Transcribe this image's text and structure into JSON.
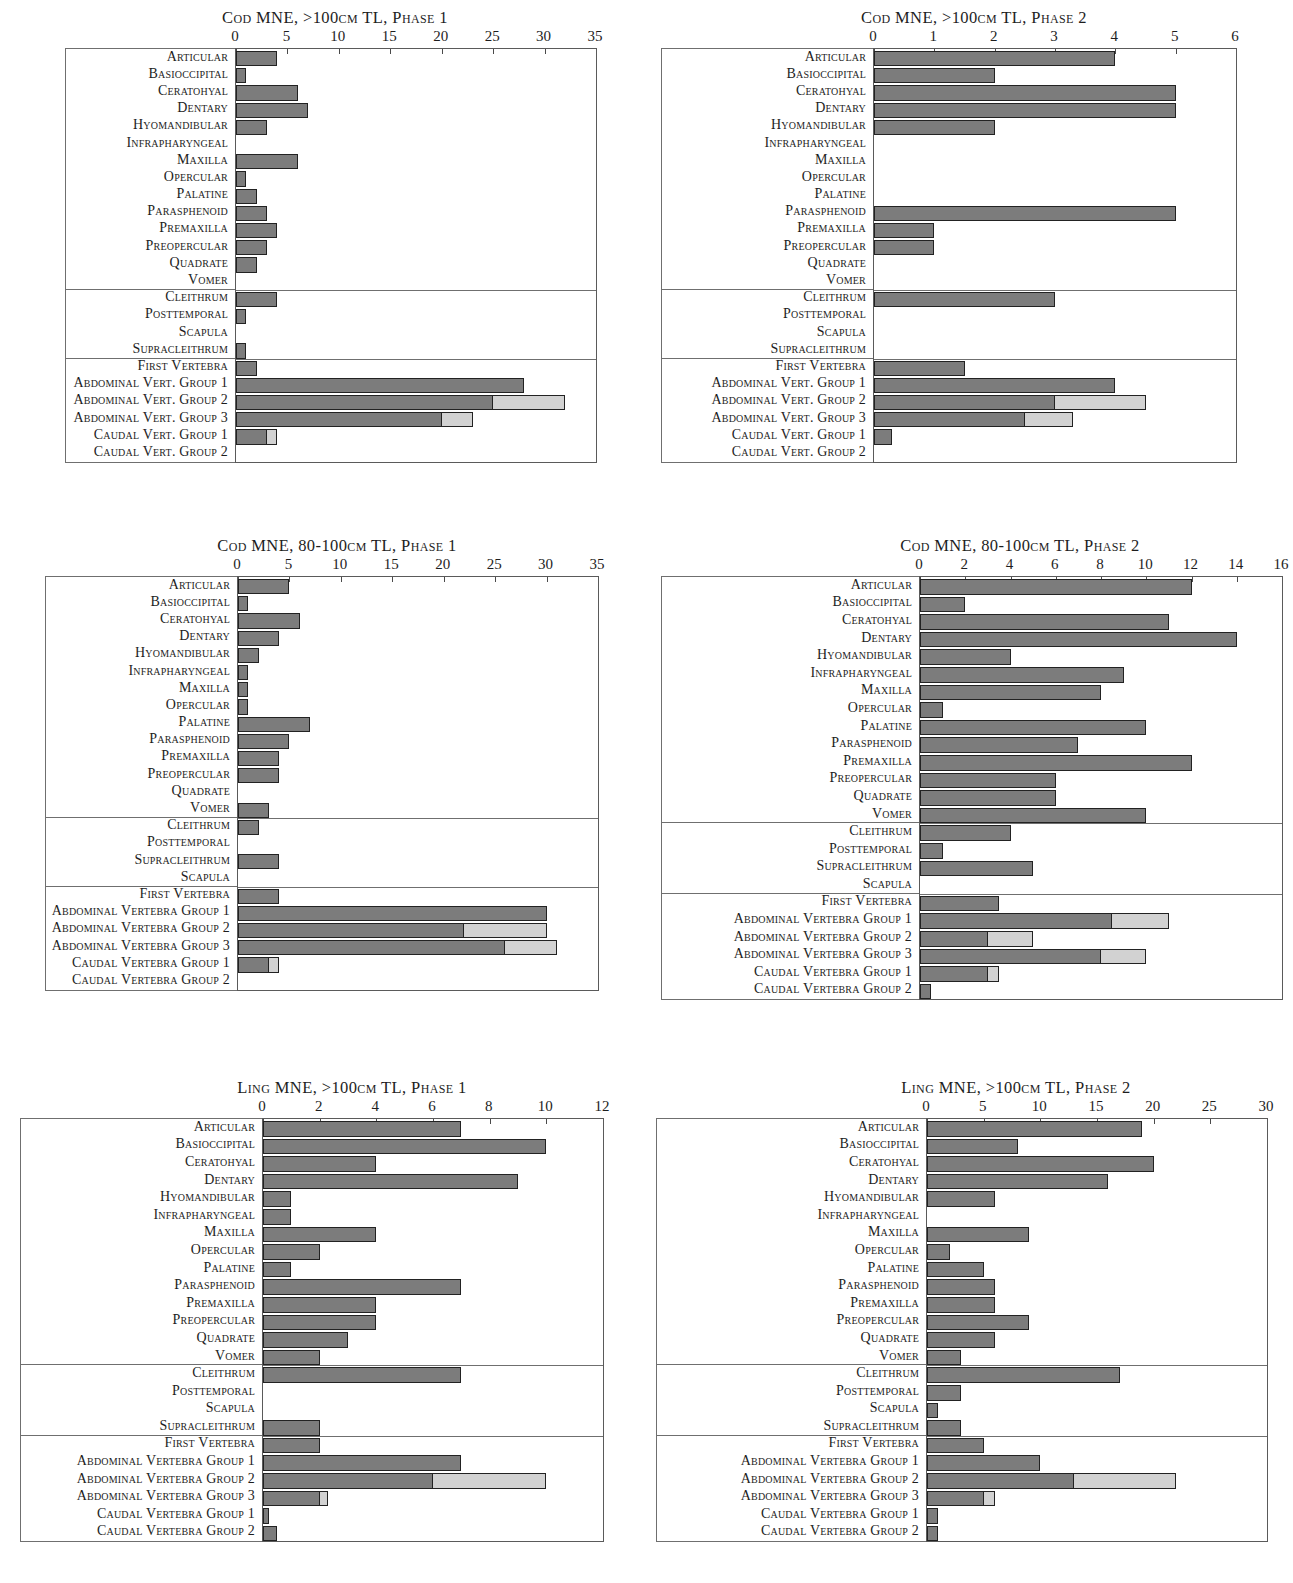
{
  "colors": {
    "bar_dark": "#7c7c7c",
    "bar_light": "#d2d2d2",
    "outline": "#222222",
    "axis": "#5a5a5a",
    "text": "#1d1d1d"
  },
  "charts": [
    {
      "id": "cod-gt100-phase1",
      "title": "Cod MNE, >100cm TL, Phase 1",
      "type": "bar",
      "orientation": "horizontal",
      "stacked": true,
      "xlabel": "",
      "ylabel": "",
      "xlim": [
        0,
        35
      ],
      "xticks": [
        0,
        5,
        10,
        15,
        20,
        25,
        30,
        35
      ],
      "grid": false,
      "legend": null,
      "series": [
        {
          "name": "identified",
          "color": "#7c7c7c"
        },
        {
          "name": "unidentified",
          "color": "#d2d2d2"
        }
      ],
      "group_breaks": [
        13,
        17
      ],
      "categories": [
        "Articular",
        "Basioccipital",
        "Ceratohyal",
        "Dentary",
        "Hyomandibular",
        "Infrapharyngeal",
        "Maxilla",
        "Opercular",
        "Palatine",
        "Parasphenoid",
        "Premaxilla",
        "Preopercular",
        "Quadrate",
        "Vomer",
        "Cleithrum",
        "Posttemporal",
        "Scapula",
        "Supracleithrum",
        "First Vertebra",
        "Abdominal Vert. Group 1",
        "Abdominal Vert. Group 2",
        "Abdominal Vert. Group 3",
        "Caudal Vert. Group 1",
        "Caudal Vert. Group 2"
      ],
      "values": [
        4,
        1,
        6,
        7,
        3,
        0,
        6,
        1,
        2,
        3,
        4,
        3,
        2,
        0,
        4,
        1,
        0,
        1,
        2,
        28,
        25,
        20,
        3,
        0
      ],
      "values_light": [
        0,
        0,
        0,
        0,
        0,
        0,
        0,
        0,
        0,
        0,
        0,
        0,
        0,
        0,
        0,
        0,
        0,
        0,
        0,
        0,
        7,
        3,
        1,
        0
      ]
    },
    {
      "id": "cod-gt100-phase2",
      "title": "Cod MNE, >100cm TL, Phase 2",
      "type": "bar",
      "orientation": "horizontal",
      "stacked": true,
      "xlabel": "",
      "ylabel": "",
      "xlim": [
        0,
        6
      ],
      "xticks": [
        0,
        1,
        2,
        3,
        4,
        5,
        6
      ],
      "grid": false,
      "legend": null,
      "series": [
        {
          "name": "identified",
          "color": "#7c7c7c"
        },
        {
          "name": "unidentified",
          "color": "#d2d2d2"
        }
      ],
      "group_breaks": [
        13,
        17
      ],
      "categories": [
        "Articular",
        "Basioccipital",
        "Ceratohyal",
        "Dentary",
        "Hyomandibular",
        "Infrapharyngeal",
        "Maxilla",
        "Opercular",
        "Palatine",
        "Parasphenoid",
        "Premaxilla",
        "Preopercular",
        "Quadrate",
        "Vomer",
        "Cleithrum",
        "Posttemporal",
        "Scapula",
        "Supracleithrum",
        "First Vertebra",
        "Abdominal Vert. Group 1",
        "Abdominal Vert. Group 2",
        "Abdominal Vert. Group 3",
        "Caudal Vert. Group 1",
        "Caudal Vert. Group 2"
      ],
      "values": [
        4,
        2,
        5,
        5,
        2,
        0,
        0,
        0,
        0,
        5,
        1,
        1,
        0,
        0,
        3,
        0,
        0,
        0,
        1.5,
        4,
        3,
        2.5,
        0.3,
        0
      ],
      "values_light": [
        0,
        0,
        0,
        0,
        0,
        0,
        0,
        0,
        0,
        0,
        0,
        0,
        0,
        0,
        0,
        0,
        0,
        0,
        0,
        0,
        1.5,
        0.8,
        0,
        0
      ]
    },
    {
      "id": "cod-80-100-phase1",
      "title": "Cod MNE, 80-100cm TL, Phase 1",
      "type": "bar",
      "orientation": "horizontal",
      "stacked": true,
      "xlabel": "",
      "ylabel": "",
      "xlim": [
        0,
        35
      ],
      "xticks": [
        0,
        5,
        10,
        15,
        20,
        25,
        30,
        35
      ],
      "grid": false,
      "legend": null,
      "series": [
        {
          "name": "identified",
          "color": "#7c7c7c"
        },
        {
          "name": "unidentified",
          "color": "#d2d2d2"
        }
      ],
      "group_breaks": [
        13,
        17
      ],
      "categories": [
        "Articular",
        "Basioccipital",
        "Ceratohyal",
        "Dentary",
        "Hyomandibular",
        "Infrapharyngeal",
        "Maxilla",
        "Opercular",
        "Palatine",
        "Parasphenoid",
        "Premaxilla",
        "Preopercular",
        "Quadrate",
        "Vomer",
        "Cleithrum",
        "Posttemporal",
        "Supracleithrum",
        "Scapula",
        "First Vertebra",
        "Abdominal Vertebra Group 1",
        "Abdominal Vertebra Group 2",
        "Abdominal Vertebra Group 3",
        "Caudal Vertebra Group 1",
        "Caudal Vertebra Group 2"
      ],
      "values": [
        5,
        1,
        6,
        4,
        2,
        1,
        1,
        1,
        7,
        5,
        4,
        4,
        0,
        3,
        2,
        0,
        4,
        0,
        4,
        30,
        22,
        26,
        3,
        0
      ],
      "values_light": [
        0,
        0,
        0,
        0,
        0,
        0,
        0,
        0,
        0,
        0,
        0,
        0,
        0,
        0,
        0,
        0,
        0,
        0,
        0,
        0,
        8,
        5,
        1,
        0
      ]
    },
    {
      "id": "cod-80-100-phase2",
      "title": "Cod MNE, 80-100cm TL, Phase 2",
      "type": "bar",
      "orientation": "horizontal",
      "stacked": true,
      "xlabel": "",
      "ylabel": "",
      "xlim": [
        0,
        16
      ],
      "xticks": [
        0,
        2,
        4,
        6,
        8,
        10,
        12,
        14,
        16
      ],
      "grid": false,
      "legend": null,
      "series": [
        {
          "name": "identified",
          "color": "#7c7c7c"
        },
        {
          "name": "unidentified",
          "color": "#d2d2d2"
        }
      ],
      "group_breaks": [
        13,
        17
      ],
      "categories": [
        "Articular",
        "Basioccipital",
        "Ceratohyal",
        "Dentary",
        "Hyomandibular",
        "Infrapharyngeal",
        "Maxilla",
        "Opercular",
        "Palatine",
        "Parasphenoid",
        "Premaxilla",
        "Preopercular",
        "Quadrate",
        "Vomer",
        "Cleithrum",
        "Posttemporal",
        "Supracleithrum",
        "Scapula",
        "First Vertebra",
        "Abdominal Vertebra Group 1",
        "Abdominal Vertebra Group 2",
        "Abdominal Vertebra Group 3",
        "Caudal Vertebra Group 1",
        "Caudal Vertebra Group 2"
      ],
      "values": [
        12,
        2,
        11,
        14,
        4,
        9,
        8,
        1,
        10,
        7,
        12,
        6,
        6,
        10,
        4,
        1,
        5,
        0,
        3.5,
        8.5,
        3,
        8,
        3,
        0.5
      ],
      "values_light": [
        0,
        0,
        0,
        0,
        0,
        0,
        0,
        0,
        0,
        0,
        0,
        0,
        0,
        0,
        0,
        0,
        0,
        0,
        0,
        2.5,
        2,
        2,
        0.5,
        0
      ]
    },
    {
      "id": "ling-gt100-phase1",
      "title": "Ling MNE, >100cm TL, Phase 1",
      "type": "bar",
      "orientation": "horizontal",
      "stacked": true,
      "xlabel": "",
      "ylabel": "",
      "xlim": [
        0,
        12
      ],
      "xticks": [
        0,
        2,
        4,
        6,
        8,
        10,
        12
      ],
      "grid": false,
      "legend": null,
      "series": [
        {
          "name": "identified",
          "color": "#7c7c7c"
        },
        {
          "name": "unidentified",
          "color": "#d2d2d2"
        }
      ],
      "group_breaks": [
        13,
        17
      ],
      "categories": [
        "Articular",
        "Basioccipital",
        "Ceratohyal",
        "Dentary",
        "Hyomandibular",
        "Infrapharyngeal",
        "Maxilla",
        "Opercular",
        "Palatine",
        "Parasphenoid",
        "Premaxilla",
        "Preopercular",
        "Quadrate",
        "Vomer",
        "Cleithrum",
        "Posttemporal",
        "Scapula",
        "Supracleithrum",
        "First Vertebra",
        "Abdominal Vertebra Group 1",
        "Abdominal Vertebra Group 2",
        "Abdominal Vertebra Group 3",
        "Caudal Vertebra Group 1",
        "Caudal Vertebra Group 2"
      ],
      "values": [
        7,
        10,
        4,
        9,
        1,
        1,
        4,
        2,
        1,
        7,
        4,
        4,
        3,
        2,
        7,
        0,
        0,
        2,
        2,
        7,
        6,
        2,
        0.2,
        0.5
      ],
      "values_light": [
        0,
        0,
        0,
        0,
        0,
        0,
        0,
        0,
        0,
        0,
        0,
        0,
        0,
        0,
        0,
        0,
        0,
        0,
        0,
        0,
        4,
        0.3,
        0,
        0
      ]
    },
    {
      "id": "ling-gt100-phase2",
      "title": "Ling MNE, >100cm TL, Phase 2",
      "type": "bar",
      "orientation": "horizontal",
      "stacked": true,
      "xlabel": "",
      "ylabel": "",
      "xlim": [
        0,
        30
      ],
      "xticks": [
        0,
        5,
        10,
        15,
        20,
        25,
        30
      ],
      "grid": false,
      "legend": null,
      "series": [
        {
          "name": "identified",
          "color": "#7c7c7c"
        },
        {
          "name": "unidentified",
          "color": "#d2d2d2"
        }
      ],
      "group_breaks": [
        13,
        17
      ],
      "categories": [
        "Articular",
        "Basioccipital",
        "Ceratohyal",
        "Dentary",
        "Hyomandibular",
        "Infrapharyngeal",
        "Maxilla",
        "Opercular",
        "Palatine",
        "Parasphenoid",
        "Premaxilla",
        "Preopercular",
        "Quadrate",
        "Vomer",
        "Cleithrum",
        "Posttemporal",
        "Scapula",
        "Supracleithrum",
        "First Vertebra",
        "Abdominal Vertebra Group 1",
        "Abdominal Vertebra Group 2",
        "Abdominal Vertebra Group 3",
        "Caudal Vertebra Group 1",
        "Caudal Vertebra Group 2"
      ],
      "values": [
        19,
        8,
        20,
        16,
        6,
        0,
        9,
        2,
        5,
        6,
        6,
        9,
        6,
        3,
        17,
        3,
        1,
        3,
        5,
        10,
        13,
        5,
        1,
        1
      ],
      "values_light": [
        0,
        0,
        0,
        0,
        0,
        0,
        0,
        0,
        0,
        0,
        0,
        0,
        0,
        0,
        0,
        0,
        0,
        0,
        0,
        0,
        9,
        1,
        0,
        0
      ]
    }
  ]
}
